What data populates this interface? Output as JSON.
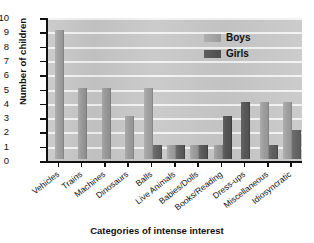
{
  "chart_data": {
    "type": "bar",
    "title": "",
    "xlabel": "Categories of intense interest",
    "ylabel": "Number of children",
    "ylim": [
      0,
      10
    ],
    "ytick_labels": [
      "10",
      "9",
      "8",
      "7",
      "6",
      "5",
      "4",
      "3",
      "2",
      "1",
      "0"
    ],
    "grid": true,
    "legend_position": "top-right",
    "categories": [
      "Vehicles",
      "Trains",
      "Machines",
      "Dinosaurs",
      "Balls",
      "Live Animals",
      "Babies/Dolls",
      "Books/Reading",
      "Dress-ups",
      "Miscellaneous",
      "Idiosyncratic"
    ],
    "series": [
      {
        "name": "Boys",
        "color": "#9a9a9a",
        "values": [
          9,
          5,
          5,
          3,
          5,
          1,
          1,
          1,
          0,
          4,
          4
        ]
      },
      {
        "name": "Girls",
        "color": "#4d4d4d",
        "values": [
          0,
          0,
          0,
          0,
          1,
          1,
          1,
          3,
          4,
          1,
          2
        ]
      }
    ]
  },
  "legend": {
    "items": [
      {
        "label": "Boys"
      },
      {
        "label": "Girls"
      }
    ]
  }
}
